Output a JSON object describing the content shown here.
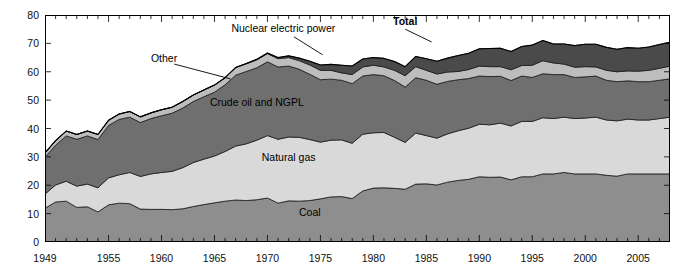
{
  "chart_data": {
    "type": "area",
    "title": "",
    "xlabel": "",
    "ylabel": "Quadrillion Btu (cumulative)",
    "ylim": [
      0,
      80
    ],
    "xlim": [
      1949,
      2008
    ],
    "ytick_labels": [
      "0",
      "10",
      "20",
      "30",
      "40",
      "50",
      "60",
      "70",
      "80"
    ],
    "ytick_values": [
      0,
      10,
      20,
      30,
      40,
      50,
      60,
      70,
      80
    ],
    "xtick_labels": [
      "1949",
      "1955",
      "1960",
      "1965",
      "1970",
      "1975",
      "1980",
      "1985",
      "1990",
      "1995",
      "2000",
      "2005"
    ],
    "xtick_values": [
      1949,
      1955,
      1960,
      1965,
      1970,
      1975,
      1980,
      1985,
      1990,
      1995,
      2000,
      2005
    ],
    "minor_xtick_interval": 1,
    "grid": false,
    "legend_position": "inline-annotations",
    "stacked": true,
    "annotations": [
      {
        "name": "total-label",
        "text": "Total",
        "bold": true,
        "x": 1983.0,
        "y": 76.5
      },
      {
        "name": "nuclear-label",
        "text": "Nuclear electric power",
        "bold": false,
        "x": 1971.5,
        "y": 74.0
      },
      {
        "name": "other-label",
        "text": "Other",
        "bold": false,
        "x": 1959.0,
        "y": 63.5
      },
      {
        "name": "crude-oil-label",
        "text": "Crude oil and NGPL",
        "bold": false,
        "x": 1969.0,
        "y": 48.0
      },
      {
        "name": "natural-gas-label",
        "text": "Natural gas",
        "bold": false,
        "x": 1972.0,
        "y": 28.5
      },
      {
        "name": "coal-label",
        "text": "Coal",
        "bold": false,
        "x": 1974.0,
        "y": 9.0
      }
    ],
    "x": [
      1949,
      1950,
      1951,
      1952,
      1953,
      1954,
      1955,
      1956,
      1957,
      1958,
      1959,
      1960,
      1961,
      1962,
      1963,
      1964,
      1965,
      1966,
      1967,
      1968,
      1969,
      1970,
      1971,
      1972,
      1973,
      1974,
      1975,
      1976,
      1977,
      1978,
      1979,
      1980,
      1981,
      1982,
      1983,
      1984,
      1985,
      1986,
      1987,
      1988,
      1989,
      1990,
      1991,
      1992,
      1993,
      1994,
      1995,
      1996,
      1997,
      1998,
      1999,
      2000,
      2001,
      2002,
      2003,
      2004,
      2005,
      2006,
      2007,
      2008
    ],
    "series": [
      {
        "name": "Coal",
        "color": "#8e8e8e",
        "values": [
          11.9,
          14.1,
          14.4,
          12.2,
          12.4,
          10.6,
          13.1,
          13.7,
          13.5,
          11.6,
          11.5,
          11.5,
          11.4,
          11.7,
          12.5,
          13.2,
          13.8,
          14.4,
          14.8,
          14.6,
          14.9,
          15.5,
          13.7,
          14.5,
          14.4,
          14.6,
          15.2,
          15.9,
          16.0,
          15.3,
          18.0,
          19.0,
          19.1,
          18.9,
          18.6,
          20.4,
          20.5,
          20.1,
          21.1,
          21.7,
          22.1,
          23.0,
          22.8,
          22.9,
          21.9,
          23.0,
          23.0,
          24.0,
          24.0,
          24.5,
          24.0,
          24.0,
          24.0,
          23.5,
          23.2,
          24.0,
          24.0,
          24.0,
          24.0,
          24.0
        ],
        "stack_order": 1
      },
      {
        "name": "Natural gas",
        "color": "#d9d9d9",
        "values": [
          5.0,
          6.0,
          7.0,
          7.5,
          8.0,
          8.5,
          9.5,
          10.0,
          11.0,
          11.5,
          12.5,
          13.0,
          13.5,
          14.5,
          15.5,
          16.0,
          16.5,
          17.5,
          19.0,
          20.0,
          21.0,
          22.0,
          22.5,
          22.5,
          22.5,
          21.5,
          20.0,
          20.0,
          20.0,
          19.5,
          20.0,
          19.5,
          19.5,
          18.0,
          16.5,
          18.0,
          17.0,
          16.5,
          17.0,
          17.5,
          18.0,
          18.5,
          18.5,
          19.0,
          19.0,
          19.5,
          19.5,
          19.8,
          19.5,
          19.5,
          19.5,
          19.7,
          20.0,
          19.5,
          19.5,
          19.3,
          19.0,
          19.0,
          19.5,
          20.0
        ],
        "stack_order": 2
      },
      {
        "name": "Crude oil and NGPL",
        "color": "#6f6f6f",
        "values": [
          13.0,
          14.0,
          16.0,
          16.5,
          17.0,
          17.0,
          18.5,
          19.5,
          19.5,
          19.0,
          19.5,
          20.0,
          20.5,
          21.0,
          21.5,
          22.0,
          22.5,
          23.5,
          25.0,
          25.5,
          25.5,
          26.0,
          25.5,
          25.0,
          24.0,
          23.0,
          22.0,
          21.5,
          21.0,
          21.0,
          20.5,
          20.5,
          20.0,
          20.0,
          19.5,
          19.5,
          19.5,
          19.0,
          18.5,
          18.0,
          17.5,
          17.0,
          17.0,
          16.5,
          16.0,
          16.0,
          15.5,
          15.5,
          15.5,
          15.0,
          14.5,
          14.5,
          14.5,
          14.0,
          13.8,
          13.5,
          13.5,
          13.5,
          13.5,
          13.5
        ],
        "stack_order": 3
      },
      {
        "name": "Other",
        "color": "#bdbdbd",
        "values": [
          1.5,
          1.6,
          1.7,
          1.7,
          1.7,
          1.8,
          1.8,
          1.9,
          2.0,
          2.0,
          2.0,
          2.1,
          2.1,
          2.3,
          2.3,
          2.4,
          2.5,
          2.5,
          2.7,
          2.7,
          2.8,
          2.9,
          2.9,
          3.0,
          3.0,
          3.3,
          3.3,
          3.1,
          2.6,
          3.2,
          3.2,
          3.3,
          3.1,
          3.6,
          4.0,
          3.9,
          3.5,
          3.6,
          3.3,
          2.9,
          3.2,
          3.5,
          3.5,
          3.4,
          3.8,
          3.7,
          4.3,
          4.6,
          4.1,
          3.7,
          3.6,
          3.6,
          3.2,
          3.5,
          3.5,
          3.5,
          3.7,
          4.0,
          4.2,
          4.5
        ],
        "stack_order": 4
      },
      {
        "name": "Nuclear electric power",
        "color": "#4a4a4a",
        "values": [
          0,
          0,
          0,
          0,
          0,
          0,
          0,
          0,
          0,
          0,
          0,
          0,
          0,
          0,
          0,
          0,
          0,
          0,
          0,
          0.1,
          0.2,
          0.2,
          0.4,
          0.6,
          0.9,
          1.3,
          1.9,
          2.1,
          2.7,
          3.0,
          2.8,
          2.7,
          3.0,
          3.1,
          3.2,
          3.6,
          4.1,
          4.5,
          4.9,
          5.6,
          5.7,
          6.1,
          6.4,
          6.5,
          6.4,
          6.7,
          7.1,
          7.1,
          6.7,
          7.1,
          7.6,
          7.9,
          8.0,
          8.1,
          7.9,
          8.2,
          8.1,
          8.2,
          8.4,
          8.4
        ],
        "stack_order": 5
      }
    ]
  },
  "axes": {
    "y_axis_title": "Quadrillion Btu (cumulative)"
  }
}
